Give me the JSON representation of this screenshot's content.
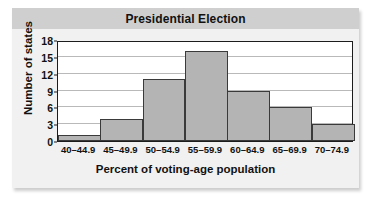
{
  "figure": {
    "title": "Presidential Election",
    "title_band_color": "#cfcfcf",
    "card_color": "#f1f1f1",
    "background_color": "#ffffff"
  },
  "chart_data": {
    "type": "bar",
    "title": "Presidential Election",
    "xlabel": "Percent of voting-age population",
    "ylabel": "Number of states",
    "categories": [
      "40–44.9",
      "45–49.9",
      "50–54.9",
      "55–59.9",
      "60–64.9",
      "65–69.9",
      "70–74.9"
    ],
    "values": [
      1,
      4,
      11,
      16,
      9,
      6,
      3
    ],
    "yticks": [
      0,
      3,
      6,
      9,
      12,
      15,
      18
    ],
    "ytick_labels": [
      "0",
      "3",
      "6",
      "9",
      "12",
      "15",
      "18"
    ],
    "ylim": [
      0,
      18
    ],
    "grid": true,
    "legend": false,
    "bar_color": "#b4b4b4",
    "bar_edge_color": "#3a3a3a",
    "gridline_color": "#b9b9b9",
    "axis_color": "#1c1c1c"
  }
}
